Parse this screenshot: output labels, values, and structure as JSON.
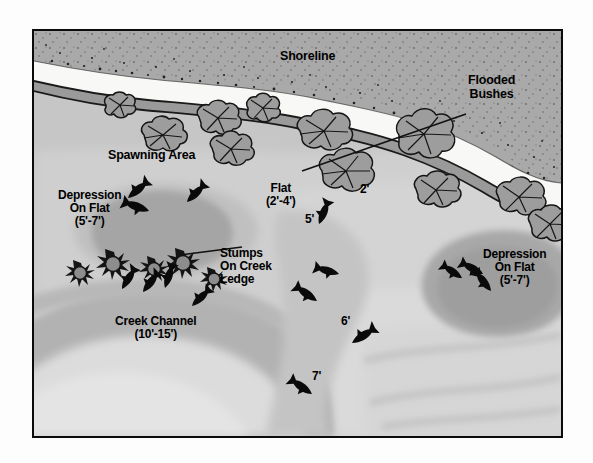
{
  "diagram": {
    "frame": {
      "border_color": "#0b0b0b",
      "background_color": "#c9c9c9"
    },
    "palette": {
      "land": "#a8a8a8",
      "beach": "#f7f7f5",
      "shallow_water": "#c2c2c2",
      "water_light": "#d2d2d2",
      "water_lighter": "#dcdcdc",
      "flat": "#cccccc",
      "depression": "#a6a6a6",
      "creek_channel": "#b0b0b0",
      "creek_deep": "#dedede",
      "bush_fill": "#9d9d9d",
      "outline": "#1a1a1a",
      "stump_fill": "#8f8f8f",
      "fish": "#0a0a0a"
    },
    "labels": [
      {
        "name": "shoreline",
        "text": "Shoreline",
        "x": 278,
        "y": 48,
        "size": "lbl-lg"
      },
      {
        "name": "flooded-bushes",
        "text": "Flooded\nBushes",
        "x": 466,
        "y": 72,
        "size": "lbl-lg"
      },
      {
        "name": "spawning-area",
        "text": "Spawning Area",
        "x": 106,
        "y": 147,
        "size": "lbl-lg"
      },
      {
        "name": "depression-on-flat-left",
        "text": "Depression\nOn Flat\n(5'-7')",
        "x": 56,
        "y": 187,
        "size": "lbl-md"
      },
      {
        "name": "flat",
        "text": "Flat\n(2'-4')",
        "x": 264,
        "y": 180,
        "size": "lbl-md"
      },
      {
        "name": "stumps-on-creek-ledge",
        "text": "Stumps\nOn Creek\nLedge",
        "x": 218,
        "y": 245,
        "size": "lbl-md"
      },
      {
        "name": "creek-channel",
        "text": "Creek Channel\n(10'-15')",
        "x": 113,
        "y": 313,
        "size": "lbl-md"
      },
      {
        "name": "depression-on-flat-right",
        "text": "Depression\nOn Flat\n(5'-7')",
        "x": 481,
        "y": 246,
        "size": "lbl-md"
      }
    ],
    "depth_markers": [
      {
        "name": "depth-2ft",
        "text": "2'",
        "x": 360,
        "y": 181
      },
      {
        "name": "depth-5ft",
        "text": "5'",
        "x": 305,
        "y": 211
      },
      {
        "name": "depth-6ft",
        "text": "6'",
        "x": 341,
        "y": 313
      },
      {
        "name": "depth-7ft",
        "text": "7'",
        "x": 312,
        "y": 368
      }
    ],
    "features": {
      "shoreline_label": "Shoreline",
      "flooded_bushes_count": 11,
      "stumps_count": 5,
      "fish_count": 16,
      "depression_count": 2,
      "leader_line": "flooded-bushes-leader"
    },
    "fish": [
      {
        "x": 126,
        "y": 196,
        "rot": -40
      },
      {
        "x": 147,
        "y": 209,
        "rot": 200
      },
      {
        "x": 185,
        "y": 200,
        "rot": -45
      },
      {
        "x": 317,
        "y": 222,
        "rot": -65
      },
      {
        "x": 337,
        "y": 272,
        "rot": 195
      },
      {
        "x": 315,
        "y": 299,
        "rot": 215
      },
      {
        "x": 350,
        "y": 341,
        "rot": -35
      },
      {
        "x": 310,
        "y": 392,
        "rot": 215
      },
      {
        "x": 120,
        "y": 287,
        "rot": -55
      },
      {
        "x": 141,
        "y": 290,
        "rot": -50
      },
      {
        "x": 163,
        "y": 286,
        "rot": -70
      },
      {
        "x": 190,
        "y": 304,
        "rot": -45
      },
      {
        "x": 460,
        "y": 276,
        "rot": 215
      },
      {
        "x": 480,
        "y": 272,
        "rot": 210
      },
      {
        "x": 489,
        "y": 289,
        "rot": 230
      }
    ],
    "stumps": [
      {
        "x": 68,
        "y": 270,
        "r": 11
      },
      {
        "x": 101,
        "y": 263,
        "r": 12
      },
      {
        "x": 143,
        "y": 267,
        "r": 11
      },
      {
        "x": 172,
        "y": 262,
        "r": 12
      },
      {
        "x": 203,
        "y": 277,
        "r": 10
      }
    ],
    "bushes": [
      {
        "x": 141,
        "y": 118,
        "w": 48,
        "h": 32
      },
      {
        "x": 196,
        "y": 104,
        "w": 40,
        "h": 28
      },
      {
        "x": 206,
        "y": 131,
        "w": 44,
        "h": 28
      },
      {
        "x": 299,
        "y": 112,
        "w": 52,
        "h": 30
      },
      {
        "x": 322,
        "y": 152,
        "w": 48,
        "h": 34
      },
      {
        "x": 398,
        "y": 115,
        "w": 48,
        "h": 38
      },
      {
        "x": 412,
        "y": 172,
        "w": 44,
        "h": 28
      },
      {
        "x": 496,
        "y": 178,
        "w": 48,
        "h": 30
      },
      {
        "x": 525,
        "y": 205,
        "w": 42,
        "h": 30
      },
      {
        "x": 103,
        "y": 96,
        "w": 30,
        "h": 22
      },
      {
        "x": 245,
        "y": 97,
        "w": 34,
        "h": 22
      }
    ]
  }
}
